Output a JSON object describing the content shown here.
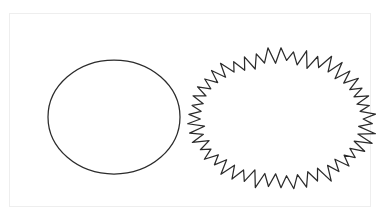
{
  "figure": {
    "title": "",
    "background_color": "#ffffff",
    "frame": {
      "name": "figure-frame",
      "border_color": "#eeeeee",
      "x": 9,
      "y": 13,
      "width": 362,
      "height": 194
    },
    "stroke_color": "#2b2b2b",
    "stroke_width": 1.25,
    "fill_color": "none",
    "shapes": [
      {
        "id": "smooth-ellipse",
        "kind": "ellipse",
        "label": "",
        "description": "smooth closed ellipse outline",
        "center_x": 114,
        "center_y": 117,
        "radius_x": 66,
        "radius_y": 57
      },
      {
        "id": "spiky-blob",
        "kind": "spiky-ellipse",
        "label": "",
        "description": "jagged star-burst closed outline with irregular spikes",
        "center_x": 281,
        "center_y": 119,
        "radius_x": 86,
        "radius_y": 62,
        "spike_count": 46,
        "spike_amplitude": 6.5
      }
    ]
  }
}
